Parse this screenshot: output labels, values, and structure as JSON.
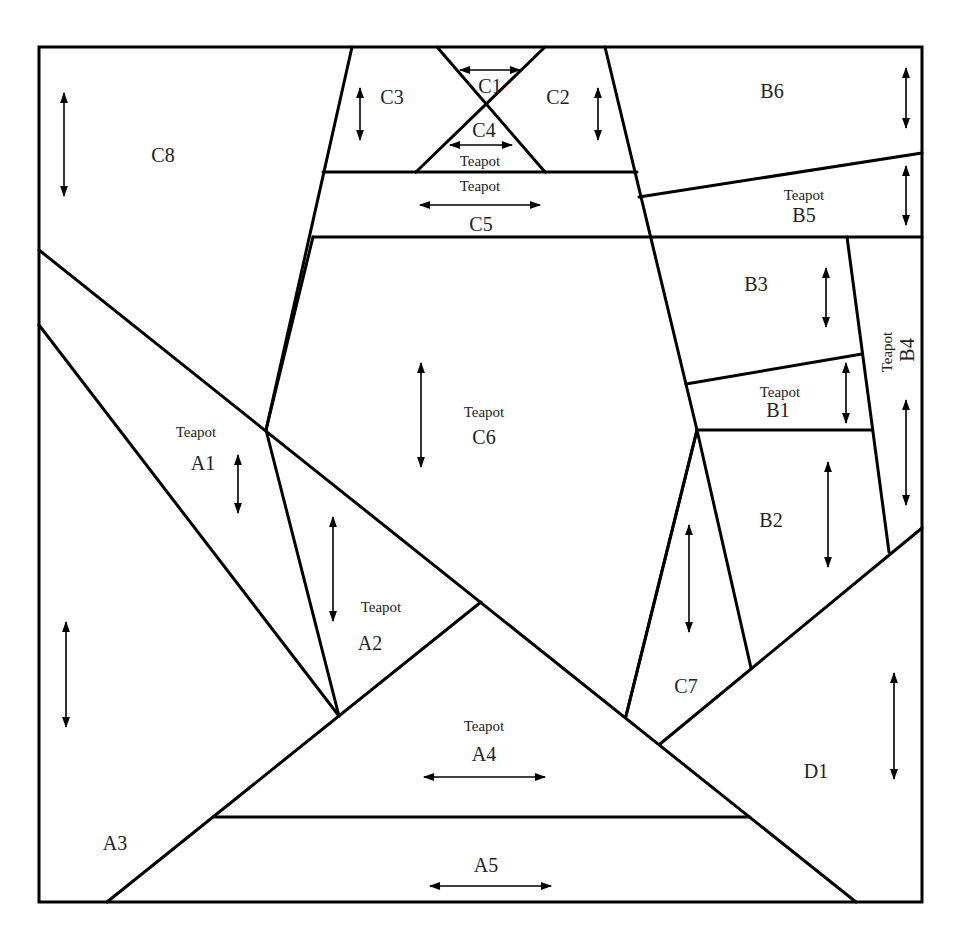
{
  "diagram": {
    "stroke_color": "#000000",
    "background": "#ffffff",
    "border": {
      "x1": 39,
      "y1": 47,
      "x2": 922,
      "y2": 902
    },
    "lines": [
      [
        352,
        47,
        266,
        430
      ],
      [
        605,
        47,
        697,
        430
      ],
      [
        437,
        47,
        545,
        172
      ],
      [
        545,
        47,
        416,
        172
      ],
      [
        323,
        172,
        637,
        172
      ],
      [
        313,
        237,
        922,
        237
      ],
      [
        313,
        237,
        266,
        430
      ],
      [
        639,
        197,
        922,
        153
      ],
      [
        847,
        237,
        889,
        552
      ],
      [
        686,
        384,
        862,
        354
      ],
      [
        697,
        430,
        872,
        430
      ],
      [
        697,
        430,
        626,
        716
      ],
      [
        697,
        430,
        751,
        668
      ],
      [
        660,
        744,
        922,
        528
      ],
      [
        39,
        250,
        856,
        902
      ],
      [
        39,
        325,
        339,
        716
      ],
      [
        266,
        430,
        339,
        716
      ],
      [
        107,
        902,
        481,
        602
      ],
      [
        215,
        817,
        750,
        817
      ],
      [
        697,
        430,
        626,
        716
      ]
    ],
    "pieces": [
      {
        "id": "C1",
        "x": 490,
        "y": 93,
        "teapot": false
      },
      {
        "id": "C2",
        "x": 558,
        "y": 104,
        "teapot": false
      },
      {
        "id": "C3",
        "x": 392,
        "y": 104,
        "teapot": false
      },
      {
        "id": "C4",
        "x": 484,
        "y": 137,
        "teapot": false
      },
      {
        "id": "C5",
        "x": 481,
        "y": 231,
        "teapot": false
      },
      {
        "id": "C6",
        "x": 484,
        "y": 444,
        "teapot": true,
        "tx": 484,
        "ty": 417
      },
      {
        "id": "C7",
        "x": 686,
        "y": 693,
        "teapot": false
      },
      {
        "id": "C8",
        "x": 163,
        "y": 162,
        "teapot": false
      },
      {
        "id": "B1",
        "x": 778,
        "y": 417,
        "teapot": true,
        "tx": 780,
        "ty": 397
      },
      {
        "id": "B2",
        "x": 771,
        "y": 527,
        "teapot": false
      },
      {
        "id": "B3",
        "x": 756,
        "y": 291,
        "teapot": false
      },
      {
        "id": "B4",
        "x": 914,
        "y": 350,
        "teapot": true,
        "rotated": true,
        "tx": 892,
        "ty": 352
      },
      {
        "id": "B5",
        "x": 804,
        "y": 222,
        "teapot": true,
        "tx": 804,
        "ty": 200
      },
      {
        "id": "B6",
        "x": 772,
        "y": 98,
        "teapot": false
      },
      {
        "id": "A1",
        "x": 203,
        "y": 470,
        "teapot": true,
        "tx": 196,
        "ty": 437
      },
      {
        "id": "A2",
        "x": 370,
        "y": 650,
        "teapot": true,
        "tx": 381,
        "ty": 612
      },
      {
        "id": "A3",
        "x": 115,
        "y": 850,
        "teapot": false
      },
      {
        "id": "A4",
        "x": 484,
        "y": 761,
        "teapot": true,
        "tx": 484,
        "ty": 731
      },
      {
        "id": "A5",
        "x": 486,
        "y": 872,
        "teapot": false
      },
      {
        "id": "D1",
        "x": 816,
        "y": 778,
        "teapot": false
      }
    ],
    "extra_teapot_labels": [
      {
        "x": 480,
        "y": 166,
        "text": "Teapot"
      },
      {
        "x": 480,
        "y": 191,
        "text": "Teapot"
      }
    ],
    "teapot_text": "Teapot",
    "arrows": [
      {
        "dir": "v",
        "x": 64,
        "y1": 93,
        "y2": 196
      },
      {
        "dir": "v",
        "x": 360,
        "y1": 88,
        "y2": 140
      },
      {
        "dir": "v",
        "x": 598,
        "y1": 88,
        "y2": 140
      },
      {
        "dir": "v",
        "x": 906,
        "y1": 68,
        "y2": 128
      },
      {
        "dir": "v",
        "x": 906,
        "y1": 166,
        "y2": 225
      },
      {
        "dir": "v",
        "x": 826,
        "y1": 268,
        "y2": 327
      },
      {
        "dir": "v",
        "x": 846,
        "y1": 363,
        "y2": 423
      },
      {
        "dir": "v",
        "x": 906,
        "y1": 400,
        "y2": 505
      },
      {
        "dir": "v",
        "x": 828,
        "y1": 462,
        "y2": 567
      },
      {
        "dir": "v",
        "x": 689,
        "y1": 525,
        "y2": 632
      },
      {
        "dir": "v",
        "x": 894,
        "y1": 673,
        "y2": 779
      },
      {
        "dir": "v",
        "x": 421,
        "y1": 363,
        "y2": 467
      },
      {
        "dir": "v",
        "x": 238,
        "y1": 455,
        "y2": 513
      },
      {
        "dir": "v",
        "x": 333,
        "y1": 517,
        "y2": 621
      },
      {
        "dir": "v",
        "x": 66,
        "y1": 622,
        "y2": 727
      },
      {
        "dir": "h",
        "y": 70,
        "x1": 460,
        "x2": 520
      },
      {
        "dir": "h",
        "y": 145,
        "x1": 450,
        "x2": 512
      },
      {
        "dir": "h",
        "y": 205,
        "x1": 420,
        "x2": 540
      },
      {
        "dir": "h",
        "y": 777,
        "x1": 424,
        "x2": 545
      },
      {
        "dir": "h",
        "y": 886,
        "x1": 430,
        "x2": 551
      }
    ]
  }
}
